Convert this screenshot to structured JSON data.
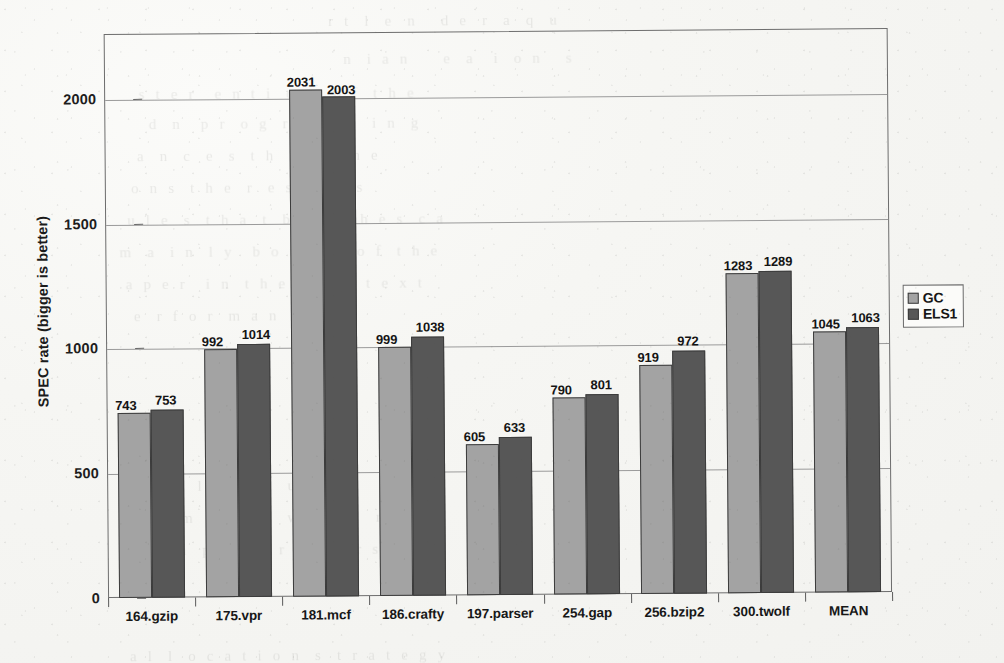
{
  "chart_data": {
    "type": "bar",
    "title": "",
    "xlabel": "",
    "ylabel": "SPEC rate (bigger is better)",
    "ylim": [
      0,
      2260
    ],
    "yticks": [
      0,
      500,
      1000,
      1500,
      2000
    ],
    "ytick_labels": [
      "0",
      "500",
      "1000",
      "1500",
      "2000"
    ],
    "grid": "horizontal",
    "legend_position": "right-outside",
    "categories": [
      "164.gzip",
      "175.vpr",
      "181.mcf",
      "186.crafty",
      "197.parser",
      "254.gap",
      "256.bzip2",
      "300.twolf",
      "MEAN"
    ],
    "series": [
      {
        "name": "GC",
        "color": "#a3a3a3",
        "values": [
          743,
          992,
          2031,
          999,
          605,
          790,
          919,
          1283,
          1045
        ]
      },
      {
        "name": "ELS1",
        "color": "#575757",
        "values": [
          753,
          1014,
          2003,
          1038,
          633,
          801,
          972,
          1289,
          1063
        ]
      }
    ],
    "data_labels_shown": true
  },
  "legend": {
    "items": [
      {
        "label": "GC",
        "swatch": "light-gray-square"
      },
      {
        "label": "ELS1",
        "swatch": "dark-gray-square"
      }
    ]
  },
  "page": {
    "bleed_through_lines": [
      "r  t   l   e   n     d  e   r   a   q   u",
      "n   i  a  n       e   a    i   o  n     s",
      "s  t  e  r    e  n  t  i   o  n    o  f   t  h  e",
      "d   n    p  r   o  g   r  a  m   m   i  n   g",
      "a   n   c   e   s   t  h   a   t   t   h  e",
      "o  n  s   t  h  e   r   e  s  u   l  t  s",
      "u  l  e   s   t  h  a   t   b  e   n  c  h  e  s   c  a",
      "m   a   i  n   l  y    b  o  t  h   y    o  f   t  h  e",
      "a  p  e  r    i  n   t  h  e     c  o  n  t  e  x  t",
      "e   r  f  o  r   m  a  n   c   e",
      "n   t   a   l    s   e   t   u   p",
      "e  r  i   m   e  n  t  s    w   e  r  e    r  u  n",
      "c   o  m   p   i  l  e   r      v   e  r  s   i   o  n",
      "a  l   l   o  c  a  t  i  o  n   s   t  r  a  t  e  g  y"
    ]
  }
}
